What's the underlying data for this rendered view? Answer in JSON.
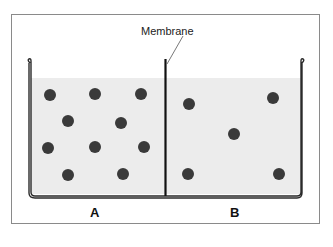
{
  "diagram": {
    "membrane_label": "Membrane",
    "side_labels": [
      "A",
      "B"
    ],
    "colors": {
      "liquid": "#ececec",
      "particle": "#3a3a3a",
      "frame": "#8a8a8a",
      "wall": "#2a2a2a"
    },
    "side_a": {
      "particle_count": 10
    },
    "side_b": {
      "particle_count": 5
    }
  }
}
